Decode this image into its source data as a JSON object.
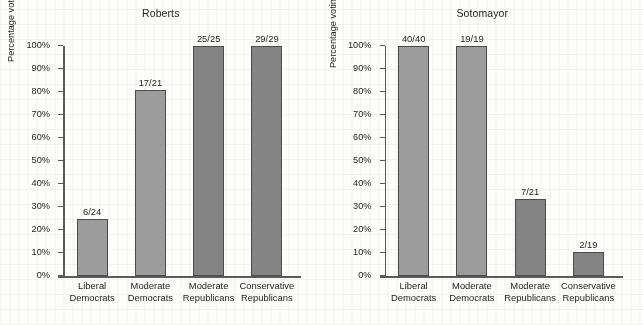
{
  "figure": {
    "background_color": "#fdfdfb",
    "bar_color_democrat": "#9c9c9c",
    "bar_color_republican": "#848484",
    "bar_outline_color": "#4b4b4b",
    "axis_color": "#5a5a5a"
  },
  "chart_data": [
    {
      "type": "bar",
      "title": "Roberts",
      "xlabel": "",
      "ylabel": "Percentage voting for Roberts by party and ideology",
      "categories": [
        "Liberal Democrats",
        "Moderate Democrats",
        "Moderate Republicans",
        "Conservative Republicans"
      ],
      "category_lines": [
        [
          "Liberal",
          "Democrats"
        ],
        [
          "Moderate",
          "Democrats"
        ],
        [
          "Moderate",
          "Republicans"
        ],
        [
          "Conservative",
          "Republicans"
        ]
      ],
      "values": [
        25,
        81,
        100,
        100
      ],
      "data_labels": [
        "6/24",
        "17/21",
        "25/25",
        "29/29"
      ],
      "group": [
        "dem",
        "dem",
        "rep",
        "rep"
      ],
      "ylim": [
        0,
        100
      ],
      "ytick_values": [
        0,
        10,
        20,
        30,
        40,
        50,
        60,
        70,
        80,
        90,
        100
      ],
      "ytick_labels": [
        "0%",
        "10%",
        "20%",
        "30%",
        "40%",
        "50%",
        "60%",
        "70%",
        "80%",
        "90%",
        "100%"
      ],
      "grid": false,
      "legend": "none"
    },
    {
      "type": "bar",
      "title": "Sotomayor",
      "xlabel": "",
      "ylabel": "Percentage voting for Sotomayor by party and ideology",
      "categories": [
        "Liberal Democrats",
        "Moderate Democrats",
        "Moderate Republicans",
        "Conservative Republicans"
      ],
      "category_lines": [
        [
          "Liberal",
          "Democrats"
        ],
        [
          "Moderate",
          "Democrats"
        ],
        [
          "Moderate",
          "Republicans"
        ],
        [
          "Conservative",
          "Republicans"
        ]
      ],
      "values": [
        100,
        100,
        33.3,
        10.5
      ],
      "data_labels": [
        "40/40",
        "19/19",
        "7/21",
        "2/19"
      ],
      "group": [
        "dem",
        "dem",
        "rep",
        "rep"
      ],
      "ylim": [
        0,
        100
      ],
      "ytick_values": [
        0,
        10,
        20,
        30,
        40,
        50,
        60,
        70,
        80,
        90,
        100
      ],
      "ytick_labels": [
        "0%",
        "10%",
        "20%",
        "30%",
        "40%",
        "50%",
        "60%",
        "70%",
        "80%",
        "90%",
        "100%"
      ],
      "grid": false,
      "legend": "none"
    }
  ]
}
